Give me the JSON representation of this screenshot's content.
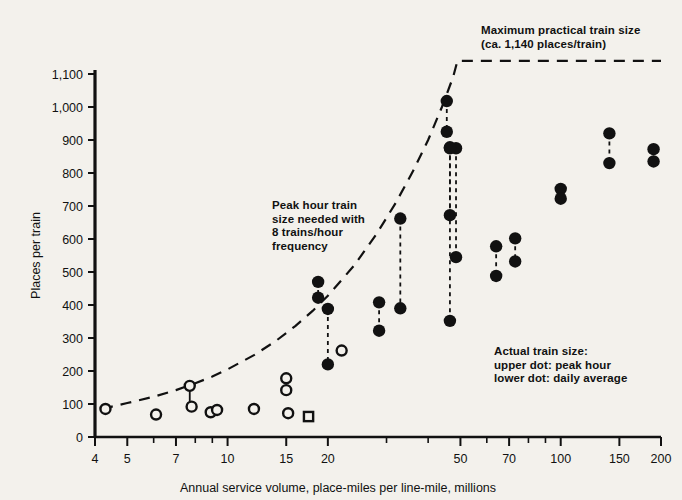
{
  "chart_data": {
    "type": "scatter",
    "title": "",
    "xlabel": "Annual service volume, place-miles per line-mile, millions",
    "ylabel": "Places per train",
    "xscale": "log",
    "xlim": [
      4,
      200
    ],
    "ylim": [
      0,
      1100
    ],
    "grid": false,
    "legend_position": "none",
    "x_ticks_major": [
      4,
      5,
      7,
      10,
      15,
      20,
      50,
      70,
      100,
      150,
      200
    ],
    "x_ticks_minor": [
      6,
      8,
      9,
      30,
      40,
      60,
      80,
      90
    ],
    "x_tick_labels": [
      "4",
      "5",
      "7",
      "10",
      "15",
      "20",
      "50",
      "70",
      "100",
      "150",
      "200"
    ],
    "y_ticks": [
      0,
      100,
      200,
      300,
      400,
      500,
      600,
      700,
      800,
      900,
      1000,
      1100
    ],
    "y_tick_labels": [
      "0",
      "100",
      "200",
      "300",
      "400",
      "500",
      "600",
      "700",
      "800",
      "900",
      "1,000",
      "1,100"
    ],
    "series": [
      {
        "name": "Peak hour train size needed with 8 trains/hour frequency",
        "type": "line",
        "style": "dashed",
        "points": [
          [
            4.2,
            85
          ],
          [
            5.0,
            103
          ],
          [
            6.0,
            122
          ],
          [
            7.0,
            142
          ],
          [
            8.0,
            163
          ],
          [
            9.0,
            183
          ],
          [
            10.0,
            205
          ],
          [
            12.0,
            248
          ],
          [
            14.0,
            292
          ],
          [
            16.0,
            337
          ],
          [
            18.0,
            382
          ],
          [
            20.0,
            428
          ],
          [
            24.0,
            520
          ],
          [
            28.0,
            615
          ],
          [
            32.0,
            710
          ],
          [
            36.0,
            805
          ],
          [
            40.0,
            900
          ],
          [
            44.0,
            1000
          ],
          [
            47.5,
            1090
          ],
          [
            49.0,
            1140
          ],
          [
            200.0,
            1140
          ]
        ]
      },
      {
        "name": "Actual train size (filled dots, pairs: upper = peak hour, lower = daily average)",
        "type": "paired-dots",
        "marker": "filled-circle",
        "pairs": [
          {
            "x": 18.7,
            "peak": 470,
            "avg": 422
          },
          {
            "x": 20.0,
            "peak": 388,
            "avg": 220
          },
          {
            "x": 28.5,
            "peak": 408,
            "avg": 322
          },
          {
            "x": 33.0,
            "peak": 662,
            "avg": 390
          },
          {
            "x": 45.5,
            "peak": 1018,
            "avg": 925
          },
          {
            "x": 46.5,
            "peak": 878,
            "avg": 672
          },
          {
            "x": 48.5,
            "peak": 875,
            "avg": 545
          },
          {
            "x": 46.5,
            "peak": 875,
            "avg": 352
          },
          {
            "x": 64.0,
            "peak": 578,
            "avg": 488
          },
          {
            "x": 73.0,
            "peak": 602,
            "avg": 532
          },
          {
            "x": 100.0,
            "peak": 752,
            "avg": 722
          },
          {
            "x": 140.0,
            "peak": 920,
            "avg": 830
          },
          {
            "x": 190.0,
            "peak": 872,
            "avg": 835
          }
        ]
      },
      {
        "name": "Smaller systems (open circles)",
        "type": "points",
        "marker": "open-circle",
        "points": [
          [
            4.3,
            85
          ],
          [
            6.1,
            68
          ],
          [
            7.7,
            155
          ],
          [
            7.8,
            92
          ],
          [
            8.9,
            75
          ],
          [
            9.3,
            82
          ],
          [
            12.0,
            85
          ],
          [
            15.0,
            178
          ],
          [
            15.0,
            142
          ],
          [
            15.2,
            72
          ],
          [
            22.0,
            262
          ]
        ]
      },
      {
        "name": "Single system (open square)",
        "type": "points",
        "marker": "open-square",
        "points": [
          [
            17.5,
            62
          ]
        ]
      }
    ],
    "annotations": [
      {
        "id": "max-practical",
        "lines": [
          "Maximum practical train size",
          "(ca. 1,140 places/train)"
        ],
        "x": 481,
        "y": 24
      },
      {
        "id": "peak-hour",
        "lines": [
          "Peak hour train",
          "size needed with",
          "8 trains/hour",
          "frequency"
        ],
        "x": 272,
        "y": 199
      },
      {
        "id": "actual-train-size",
        "lines": [
          "Actual train size:",
          "upper dot: peak hour",
          "lower dot: daily average"
        ],
        "x": 494,
        "y": 345
      }
    ],
    "colors": {
      "ink": "#111111",
      "background": "#f3f1ec",
      "marker_fill": "#111111",
      "marker_open": "#f3f1ec"
    }
  }
}
